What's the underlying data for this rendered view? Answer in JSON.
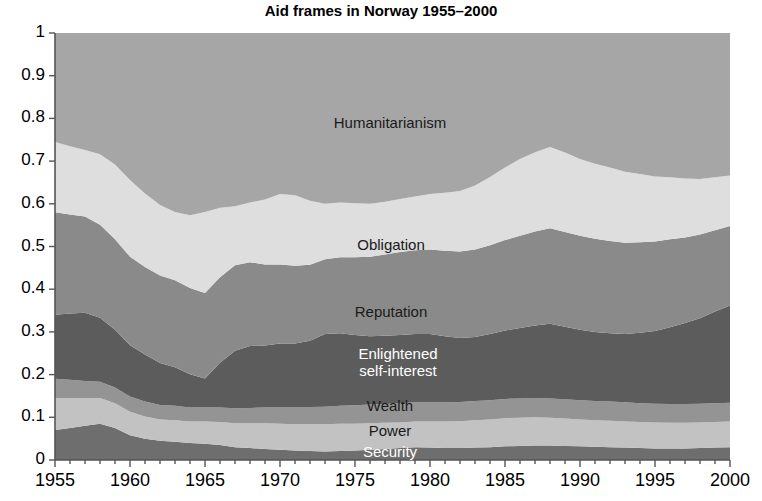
{
  "chart_data": {
    "type": "area",
    "stacked": true,
    "title": "Aid frames in Norway 1955–2000",
    "xlabel": "",
    "ylabel": "",
    "xlim": [
      1955,
      2000
    ],
    "ylim": [
      0,
      1
    ],
    "grid": false,
    "legend_position": "inline-labels",
    "x": [
      1955,
      1956,
      1957,
      1958,
      1959,
      1960,
      1961,
      1962,
      1963,
      1964,
      1965,
      1966,
      1967,
      1968,
      1969,
      1970,
      1971,
      1972,
      1973,
      1974,
      1975,
      1976,
      1977,
      1978,
      1979,
      1980,
      1981,
      1982,
      1983,
      1984,
      1985,
      1986,
      1987,
      1988,
      1989,
      1990,
      1991,
      1992,
      1993,
      1994,
      1995,
      1996,
      1997,
      1998,
      1999,
      2000
    ],
    "xticks": [
      1955,
      1960,
      1965,
      1970,
      1975,
      1980,
      1985,
      1990,
      1995,
      2000
    ],
    "xtick_labels": [
      "1955",
      "1960",
      "1965",
      "1970",
      "1975",
      "1980",
      "1985",
      "1990",
      "1995",
      "2000"
    ],
    "yticks": [
      0,
      0.1,
      0.2,
      0.3,
      0.4,
      0.5,
      0.6,
      0.7,
      0.8,
      0.9,
      1
    ],
    "ytick_labels": [
      "0",
      "0.1",
      "0.2",
      "0.3",
      "0.4",
      "0.5",
      "0.6",
      "0.7",
      "0.8",
      "0.9",
      "1"
    ],
    "series": [
      {
        "name": "Security",
        "color": "#6e6e6e",
        "label_color": "#ffffff",
        "values": [
          0.07,
          0.075,
          0.08,
          0.085,
          0.075,
          0.058,
          0.05,
          0.045,
          0.043,
          0.04,
          0.038,
          0.035,
          0.03,
          0.028,
          0.026,
          0.024,
          0.022,
          0.021,
          0.02,
          0.021,
          0.022,
          0.024,
          0.026,
          0.028,
          0.03,
          0.029,
          0.028,
          0.028,
          0.029,
          0.03,
          0.032,
          0.033,
          0.034,
          0.034,
          0.033,
          0.032,
          0.031,
          0.03,
          0.029,
          0.028,
          0.027,
          0.027,
          0.027,
          0.028,
          0.029,
          0.03
        ]
      },
      {
        "name": "Power",
        "color": "#c2c2c2",
        "label_color": "#1a1a1a",
        "values": [
          0.075,
          0.07,
          0.065,
          0.06,
          0.058,
          0.055,
          0.052,
          0.05,
          0.05,
          0.05,
          0.052,
          0.054,
          0.056,
          0.058,
          0.06,
          0.061,
          0.062,
          0.063,
          0.064,
          0.064,
          0.063,
          0.062,
          0.061,
          0.06,
          0.06,
          0.061,
          0.062,
          0.063,
          0.064,
          0.065,
          0.066,
          0.066,
          0.066,
          0.065,
          0.064,
          0.063,
          0.062,
          0.062,
          0.061,
          0.061,
          0.061,
          0.06,
          0.06,
          0.06,
          0.06,
          0.06
        ]
      },
      {
        "name": "Wealth",
        "color": "#949494",
        "label_color": "#1a1a1a",
        "values": [
          0.045,
          0.043,
          0.04,
          0.038,
          0.037,
          0.036,
          0.035,
          0.034,
          0.034,
          0.033,
          0.033,
          0.034,
          0.035,
          0.036,
          0.037,
          0.038,
          0.039,
          0.04,
          0.041,
          0.042,
          0.043,
          0.044,
          0.044,
          0.045,
          0.045,
          0.045,
          0.045,
          0.045,
          0.045,
          0.045,
          0.045,
          0.045,
          0.045,
          0.045,
          0.045,
          0.045,
          0.045,
          0.045,
          0.045,
          0.044,
          0.044,
          0.044,
          0.044,
          0.044,
          0.044,
          0.044
        ]
      },
      {
        "name": "Enlightened self-interest",
        "color": "#5c5c5c",
        "label_color": "#ffffff",
        "values": [
          0.15,
          0.155,
          0.16,
          0.15,
          0.135,
          0.12,
          0.11,
          0.098,
          0.09,
          0.078,
          0.068,
          0.105,
          0.135,
          0.145,
          0.145,
          0.15,
          0.15,
          0.155,
          0.17,
          0.17,
          0.165,
          0.16,
          0.16,
          0.16,
          0.16,
          0.16,
          0.155,
          0.15,
          0.15,
          0.155,
          0.16,
          0.165,
          0.17,
          0.175,
          0.17,
          0.165,
          0.162,
          0.16,
          0.16,
          0.165,
          0.17,
          0.18,
          0.19,
          0.2,
          0.215,
          0.228
        ]
      },
      {
        "name": "Reputation",
        "color": "#8a8a8a",
        "label_color": "#1a1a1a",
        "values": [
          0.24,
          0.232,
          0.225,
          0.218,
          0.212,
          0.207,
          0.205,
          0.205,
          0.204,
          0.202,
          0.2,
          0.2,
          0.2,
          0.196,
          0.19,
          0.185,
          0.182,
          0.178,
          0.175,
          0.178,
          0.182,
          0.186,
          0.19,
          0.194,
          0.196,
          0.198,
          0.2,
          0.202,
          0.205,
          0.208,
          0.212,
          0.216,
          0.22,
          0.224,
          0.222,
          0.22,
          0.218,
          0.216,
          0.214,
          0.212,
          0.21,
          0.206,
          0.2,
          0.196,
          0.19,
          0.186
        ]
      },
      {
        "name": "Obligation",
        "color": "#dedede",
        "label_color": "#1a1a1a",
        "values": [
          0.165,
          0.16,
          0.156,
          0.165,
          0.175,
          0.18,
          0.172,
          0.165,
          0.16,
          0.17,
          0.19,
          0.163,
          0.138,
          0.14,
          0.152,
          0.165,
          0.165,
          0.15,
          0.13,
          0.128,
          0.126,
          0.124,
          0.124,
          0.124,
          0.126,
          0.13,
          0.136,
          0.142,
          0.15,
          0.16,
          0.17,
          0.18,
          0.186,
          0.19,
          0.186,
          0.18,
          0.176,
          0.172,
          0.166,
          0.16,
          0.152,
          0.145,
          0.138,
          0.13,
          0.124,
          0.118
        ]
      },
      {
        "name": "Humanitarianism",
        "color": "#a6a6a6",
        "label_color": "#1a1a1a",
        "values": [
          0.255,
          0.265,
          0.274,
          0.284,
          0.308,
          0.344,
          0.376,
          0.403,
          0.419,
          0.427,
          0.419,
          0.409,
          0.406,
          0.397,
          0.39,
          0.377,
          0.38,
          0.393,
          0.4,
          0.397,
          0.399,
          0.4,
          0.395,
          0.389,
          0.383,
          0.377,
          0.374,
          0.37,
          0.357,
          0.337,
          0.315,
          0.295,
          0.279,
          0.267,
          0.28,
          0.295,
          0.306,
          0.315,
          0.325,
          0.33,
          0.336,
          0.338,
          0.341,
          0.342,
          0.338,
          0.334
        ]
      }
    ],
    "annotations": [
      {
        "text": "Humanitarianism",
        "x_px": 390,
        "y_px": 123,
        "color": "#1a1a1a"
      },
      {
        "text": "Obligation",
        "x_px": 391,
        "y_px": 245,
        "color": "#1a1a1a"
      },
      {
        "text": "Reputation",
        "x_px": 391,
        "y_px": 312,
        "color": "#1a1a1a"
      },
      {
        "text": "Enlightened",
        "x_px": 398,
        "y_px": 354,
        "color": "#ffffff"
      },
      {
        "text": "self-interest",
        "x_px": 398,
        "y_px": 371,
        "color": "#ffffff"
      },
      {
        "text": "Wealth",
        "x_px": 390,
        "y_px": 406,
        "color": "#1a1a1a"
      },
      {
        "text": "Power",
        "x_px": 390,
        "y_px": 431,
        "color": "#1a1a1a"
      },
      {
        "text": "Security",
        "x_px": 390,
        "y_px": 452,
        "color": "#ffffff"
      }
    ]
  },
  "axes": {
    "plot_left_px": 55,
    "plot_right_px": 730,
    "plot_top_px": 33,
    "plot_bottom_px": 460,
    "axis_color": "#555555"
  }
}
